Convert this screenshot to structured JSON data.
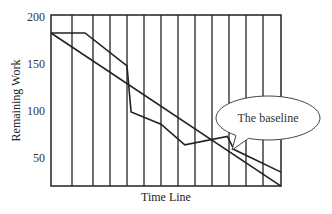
{
  "chart_data": {
    "type": "line",
    "title": "",
    "xlabel": "Time Line",
    "ylabel": "Remaining Work",
    "x_divisions": 13,
    "xlim": [
      0,
      13
    ],
    "ylim": [
      20,
      200
    ],
    "yticks": [
      200,
      150,
      100,
      50
    ],
    "grid": "vertical",
    "series": [
      {
        "name": "Baseline",
        "points": [
          [
            0,
            183
          ],
          [
            13,
            20
          ]
        ]
      },
      {
        "name": "Actual",
        "points": [
          [
            0,
            183
          ],
          [
            1.62,
            183
          ],
          [
            4,
            148
          ],
          [
            4.24,
            99
          ],
          [
            6,
            86
          ],
          [
            7.4,
            64
          ],
          [
            9.9,
            73
          ],
          [
            10.3,
            59
          ],
          [
            13,
            35
          ]
        ]
      }
    ],
    "annotations": [
      {
        "text": "The baseline",
        "points_to_series": "Baseline"
      }
    ]
  },
  "colors": {
    "line": "#222222",
    "frame": "#222222",
    "callout_stroke": "#444444",
    "background": "#ffffff"
  }
}
